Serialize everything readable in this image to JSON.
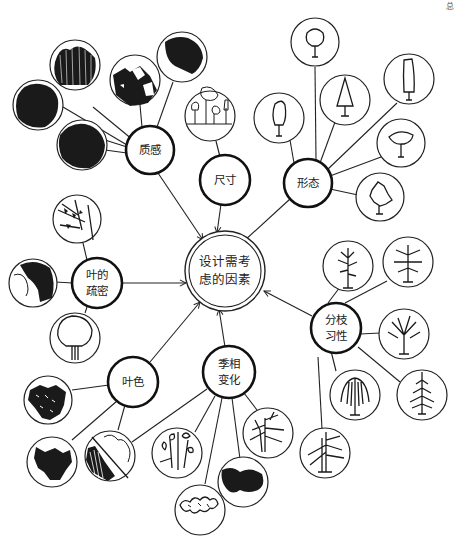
{
  "diagram": {
    "center": {
      "line1": "设计需考",
      "line2": "虑的因素"
    },
    "corner_mark": "总",
    "hubs": [
      {
        "id": "texture",
        "line1": "质感",
        "line2": "",
        "leaves": [
          "dense-fine-foliage",
          "vertical-hatched-canopy",
          "patchy-canopy",
          "dark-scribble-canopy",
          "stippled-canopy"
        ]
      },
      {
        "id": "size",
        "line1": "尺寸",
        "line2": "",
        "leaves": [
          "trees-of-varying-height"
        ]
      },
      {
        "id": "form",
        "line1": "形态",
        "line2": "",
        "leaves": [
          "oval-tree",
          "round-tree",
          "conical-tree",
          "columnar-tree",
          "spreading-tree",
          "irregular-tree"
        ]
      },
      {
        "id": "foliage-density",
        "line1": "叶的",
        "line2": "疏密",
        "leaves": [
          "sparse-branches",
          "dense-dark-canopy",
          "open-outline-tree"
        ]
      },
      {
        "id": "branching-habit",
        "line1": "分枝",
        "line2": "习性",
        "leaves": [
          "upright-branching",
          "broad-branching",
          "rounded-branching",
          "conifer-branching",
          "weeping-branching",
          "layered-branching"
        ]
      },
      {
        "id": "leaf-color",
        "line1": "叶色",
        "line2": "",
        "leaves": [
          "mottled-foliage",
          "dark-solid-foliage",
          "half-hatched-foliage"
        ]
      },
      {
        "id": "seasonal-change",
        "line1": "季相",
        "line2": "变化",
        "leaves": [
          "flowering-branches",
          "scribble-outline",
          "bare-winter-tree",
          "dense-summer-canopy"
        ]
      }
    ]
  }
}
